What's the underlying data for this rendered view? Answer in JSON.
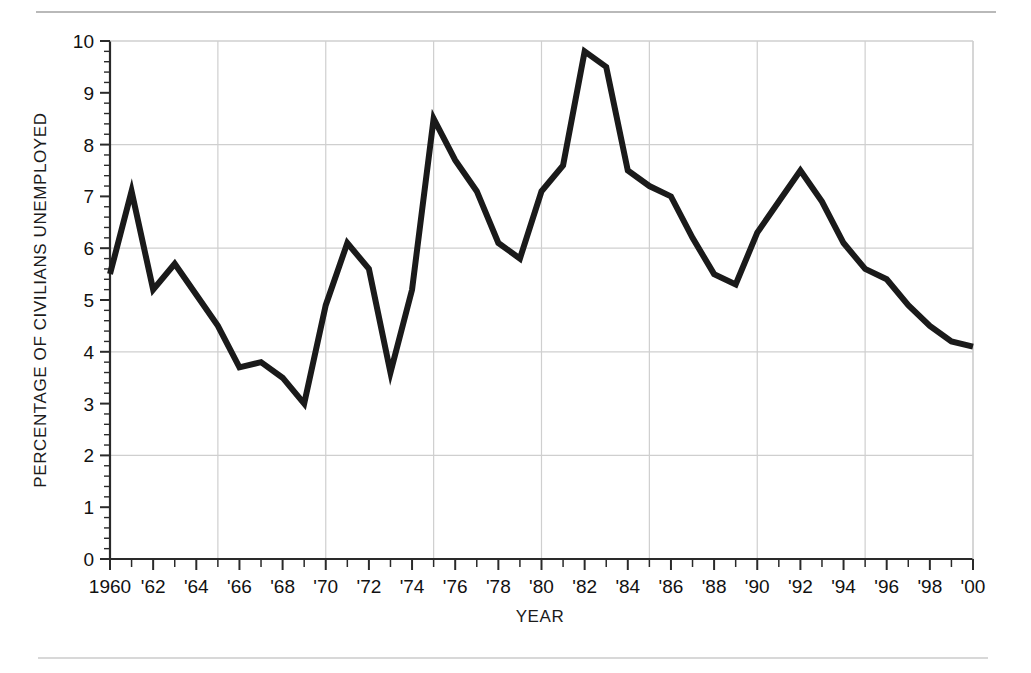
{
  "page": {
    "background_color": "#ffffff",
    "rule_color": "#c9c9c9"
  },
  "chart_data": {
    "type": "line",
    "title": "",
    "xlabel": "YEAR",
    "ylabel": "PERCENTAGE OF CIVILIANS UNEMPLOYED",
    "xlim": [
      1960,
      2000
    ],
    "ylim": [
      0,
      10
    ],
    "grid": true,
    "grid_x_step": 5,
    "grid_y_step": 2,
    "legend": "none",
    "line_color": "#1a1a1a",
    "line_width": 6,
    "y_ticks": [
      0,
      1,
      2,
      3,
      4,
      5,
      6,
      7,
      8,
      9,
      10
    ],
    "y_tick_labels": [
      "0",
      "1",
      "2",
      "3",
      "4",
      "5",
      "6",
      "7",
      "8",
      "9",
      "10"
    ],
    "y_minor_ticks_per_major": 5,
    "x_ticks": [
      1960,
      1961,
      1962,
      1963,
      1964,
      1965,
      1966,
      1967,
      1968,
      1969,
      1970,
      1971,
      1972,
      1973,
      1974,
      1975,
      1976,
      1977,
      1978,
      1979,
      1980,
      1981,
      1982,
      1983,
      1984,
      1985,
      1986,
      1987,
      1988,
      1989,
      1990,
      1991,
      1992,
      1993,
      1994,
      1995,
      1996,
      1997,
      1998,
      1999,
      2000
    ],
    "x_tick_labels": [
      "1960",
      "'62",
      "'64",
      "'66",
      "'68",
      "'70",
      "'72",
      "'74",
      "'76",
      "'78",
      "'80",
      "'82",
      "'84",
      "'86",
      "'88",
      "'90",
      "'92",
      "'94",
      "'96",
      "'98",
      "'00"
    ],
    "x_tick_label_years": [
      1960,
      1962,
      1964,
      1966,
      1968,
      1970,
      1972,
      1974,
      1976,
      1978,
      1980,
      1982,
      1984,
      1986,
      1988,
      1990,
      1992,
      1994,
      1996,
      1998,
      2000
    ],
    "x": [
      1960,
      1961,
      1962,
      1963,
      1964,
      1965,
      1966,
      1967,
      1968,
      1969,
      1970,
      1971,
      1972,
      1973,
      1974,
      1975,
      1976,
      1977,
      1978,
      1979,
      1980,
      1981,
      1982,
      1983,
      1984,
      1985,
      1986,
      1987,
      1988,
      1989,
      1990,
      1991,
      1992,
      1993,
      1994,
      1995,
      1996,
      1997,
      1998,
      1999,
      2000
    ],
    "values": [
      5.5,
      7.1,
      5.2,
      5.7,
      5.1,
      4.5,
      3.7,
      3.8,
      3.5,
      3.0,
      4.9,
      6.1,
      5.6,
      3.6,
      5.2,
      8.5,
      7.7,
      7.1,
      6.1,
      5.8,
      7.1,
      7.6,
      9.8,
      9.5,
      7.5,
      7.2,
      7.0,
      6.2,
      5.5,
      5.3,
      6.3,
      6.9,
      7.5,
      6.9,
      6.1,
      5.6,
      5.4,
      4.9,
      4.5,
      4.2,
      4.1
    ],
    "series": [
      {
        "name": "Percentage of civilians unemployed",
        "values": [
          5.5,
          7.1,
          5.2,
          5.7,
          5.1,
          4.5,
          3.7,
          3.8,
          3.5,
          3.0,
          4.9,
          6.1,
          5.6,
          3.6,
          5.2,
          8.5,
          7.7,
          7.1,
          6.1,
          5.8,
          7.1,
          7.6,
          9.8,
          9.5,
          7.5,
          7.2,
          7.0,
          6.2,
          5.5,
          5.3,
          6.3,
          6.9,
          7.5,
          6.9,
          6.1,
          5.6,
          5.4,
          4.9,
          4.5,
          4.2,
          4.1
        ]
      }
    ]
  }
}
